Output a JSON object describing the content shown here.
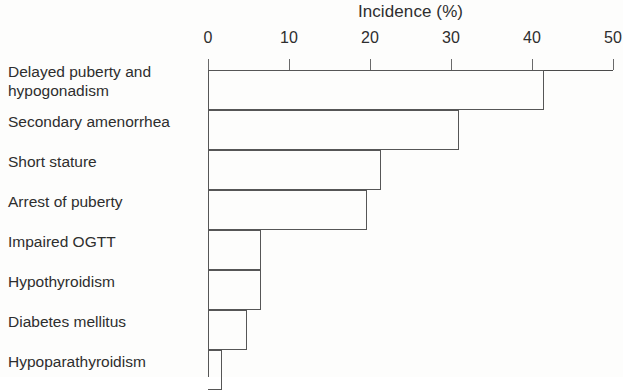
{
  "chart_data": {
    "type": "bar",
    "orientation": "horizontal",
    "title": "Incidence (%)",
    "xlabel": "Incidence (%)",
    "ylabel": "",
    "xlim": [
      0,
      50
    ],
    "xticks": [
      0,
      10,
      20,
      30,
      40,
      50
    ],
    "xtick_labels": [
      "0",
      "10",
      "20",
      "30",
      "40",
      "50"
    ],
    "grid": false,
    "legend": null,
    "categories": [
      "Delayed puberty and\nhypogonadism",
      "Secondary amenorrhea",
      "Short stature",
      "Arrest of puberty",
      "Impaired OGTT",
      "Hypothyroidism",
      "Diabetes mellitus",
      "Hypoparathyroidism"
    ],
    "values": [
      41.5,
      31,
      21.4,
      19.6,
      6.5,
      6.5,
      4.8,
      1.7
    ],
    "bar_style": {
      "fill": "none",
      "edge_color": "#565656",
      "edge_width": 1.3
    },
    "axis_color": "#4a4a4a",
    "text_color": "#2e2e2e",
    "background": "#fdfdfc"
  }
}
